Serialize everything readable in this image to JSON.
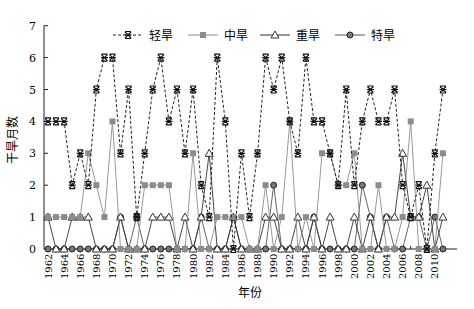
{
  "chart_data": {
    "type": "line",
    "title": "",
    "xlabel": "年份",
    "ylabel": "干旱月数",
    "ylim": [
      0,
      7
    ],
    "yticks": [
      0,
      1,
      2,
      3,
      4,
      5,
      6,
      7
    ],
    "xtick_labels": [
      "1962",
      "1964",
      "1966",
      "1968",
      "1970",
      "1972",
      "1974",
      "1976",
      "1978",
      "1980",
      "1982",
      "1984",
      "1986",
      "1988",
      "1990",
      "1992",
      "1994",
      "1996",
      "1998",
      "2000",
      "2002",
      "2004",
      "2006",
      "2008",
      "2010"
    ],
    "grid": false,
    "legend_position": "top",
    "x": [
      1962,
      1963,
      1964,
      1965,
      1966,
      1967,
      1968,
      1969,
      1970,
      1971,
      1972,
      1973,
      1974,
      1975,
      1976,
      1977,
      1978,
      1979,
      1980,
      1981,
      1982,
      1983,
      1984,
      1985,
      1986,
      1987,
      1988,
      1989,
      1990,
      1991,
      1992,
      1993,
      1994,
      1995,
      1996,
      1997,
      1998,
      1999,
      2000,
      2001,
      2002,
      2003,
      2004,
      2005,
      2006,
      2007,
      2008,
      2009,
      2010,
      2011
    ],
    "series": [
      {
        "name": "轻旱",
        "style": "dashed",
        "marker": "star",
        "color": "#222222",
        "values": [
          4,
          4,
          4,
          2,
          3,
          2,
          5,
          6,
          6,
          3,
          5,
          1,
          3,
          5,
          6,
          4,
          5,
          3,
          5,
          2,
          1,
          6,
          4,
          0,
          3,
          1,
          3,
          6,
          5,
          6,
          4,
          3,
          6,
          4,
          4,
          3,
          2,
          5,
          2,
          4,
          5,
          4,
          4,
          5,
          2,
          1,
          2,
          0,
          3,
          5
        ]
      },
      {
        "name": "中旱",
        "style": "solid",
        "marker": "square",
        "color": "#8c8c8c",
        "values": [
          1,
          1,
          1,
          1,
          1,
          3,
          2,
          1,
          4,
          0,
          0,
          0,
          2,
          2,
          2,
          2,
          0,
          0,
          3,
          0,
          0,
          1,
          1,
          1,
          1,
          0,
          0,
          2,
          0,
          1,
          4,
          0,
          1,
          0,
          3,
          3,
          2,
          2,
          3,
          0,
          0,
          2,
          0,
          0,
          1,
          4,
          0,
          0,
          0,
          3
        ]
      },
      {
        "name": "重旱",
        "style": "solid",
        "marker": "triangle",
        "color": "#333333",
        "values": [
          1,
          0,
          0,
          1,
          1,
          1,
          0,
          0,
          0,
          1,
          0,
          0,
          0,
          1,
          1,
          1,
          0,
          1,
          0,
          1,
          3,
          0,
          0,
          1,
          0,
          0,
          0,
          1,
          1,
          0,
          0,
          1,
          0,
          1,
          0,
          1,
          0,
          0,
          1,
          0,
          1,
          0,
          1,
          1,
          3,
          1,
          1,
          2,
          0,
          1
        ]
      },
      {
        "name": "特旱",
        "style": "solid",
        "marker": "circle",
        "color": "#555555",
        "values": [
          0,
          0,
          0,
          0,
          0,
          0,
          0,
          0,
          0,
          1,
          0,
          1,
          0,
          0,
          0,
          0,
          0,
          0,
          0,
          1,
          0,
          0,
          0,
          1,
          0,
          0,
          0,
          0,
          2,
          0,
          0,
          0,
          0,
          1,
          0,
          0,
          0,
          0,
          0,
          2,
          1,
          0,
          1,
          0,
          0,
          1,
          1,
          0,
          1,
          0
        ]
      }
    ]
  },
  "legend": {
    "items": [
      "轻旱",
      "中旱",
      "重旱",
      "特旱"
    ]
  },
  "axes": {
    "xlabel": "年份",
    "ylabel": "干旱月数"
  }
}
